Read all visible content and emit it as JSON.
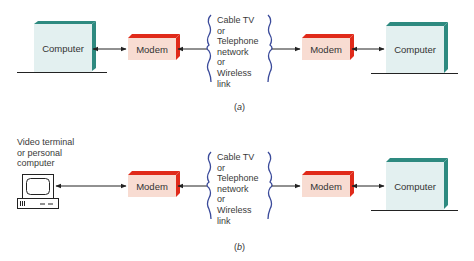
{
  "colors": {
    "computer_face": "#e3f0f0",
    "computer_edge": "#2e8a80",
    "modem_face": "#f8dcd2",
    "modem_edge": "#e02a1a",
    "brace": "#3a4a9a",
    "line": "#222222"
  },
  "panel_a": {
    "left_computer": {
      "label": "Computer"
    },
    "left_modem": {
      "label": "Modem"
    },
    "network": {
      "lines": [
        "Cable TV",
        "or",
        "Telephone",
        "network",
        "or",
        "Wireless",
        "link"
      ]
    },
    "right_modem": {
      "label": "Modem"
    },
    "right_computer": {
      "label": "Computer"
    },
    "caption": {
      "open": "(",
      "letter": "a",
      "close": ")"
    }
  },
  "panel_b": {
    "terminal": {
      "label_lines": [
        "Video terminal",
        "or personal",
        "computer"
      ],
      "icon": "terminal-icon"
    },
    "left_modem": {
      "label": "Modem"
    },
    "network": {
      "lines": [
        "Cable TV",
        "or",
        "Telephone",
        "network",
        "or",
        "Wireless",
        "link"
      ]
    },
    "right_modem": {
      "label": "Modem"
    },
    "right_computer": {
      "label": "Computer"
    },
    "caption": {
      "open": "(",
      "letter": "b",
      "close": ")"
    }
  }
}
